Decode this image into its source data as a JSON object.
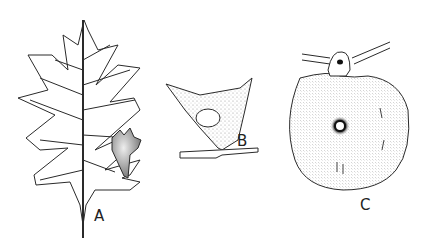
{
  "figure": {
    "panels": [
      {
        "id": "A",
        "label": "A",
        "description": "Lobed oak leaf with a gall on the right margin"
      },
      {
        "id": "B",
        "label": "B",
        "description": "Cross-section of a stippled gall with a central cavity attached to a stem"
      },
      {
        "id": "C",
        "label": "C",
        "description": "Round disc-shaped gall with a central hole, attached under a twig"
      }
    ]
  },
  "colors": {
    "background": "#ffffff",
    "ink": "#2a2a2a",
    "stipple": "#d9d9d9"
  }
}
